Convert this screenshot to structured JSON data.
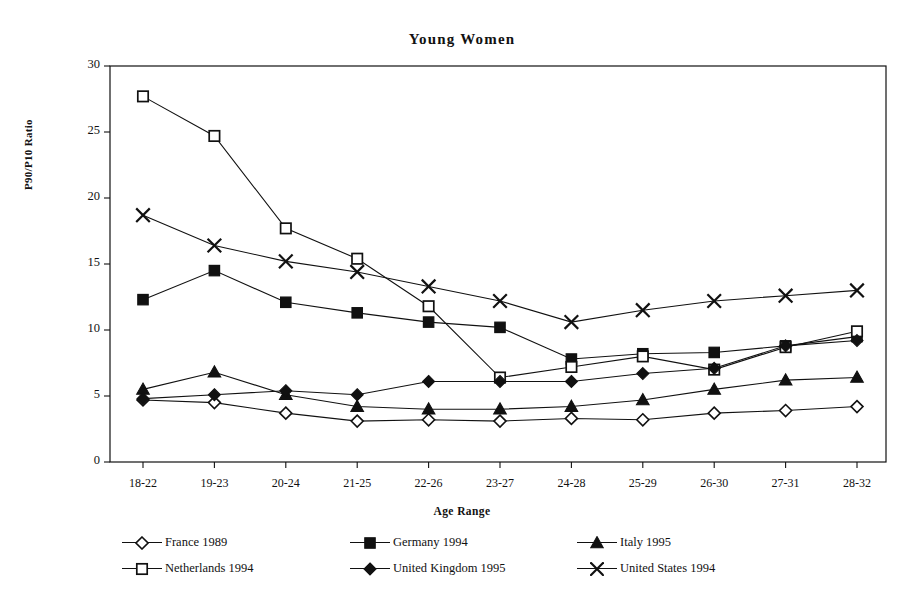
{
  "figure": {
    "title": "Young Women",
    "xlabel": "Age Range",
    "ylabel": "P90/P10 Ratio"
  },
  "axes": {
    "yticks": [
      "0",
      "5",
      "10",
      "15",
      "20",
      "25",
      "30"
    ],
    "xticks": [
      "18-22",
      "19-23",
      "20-24",
      "21-25",
      "22-26",
      "23-27",
      "24-28",
      "25-29",
      "26-30",
      "27-31",
      "28-32"
    ]
  },
  "legend": {
    "rows": [
      [
        {
          "label": "France 1989",
          "marker": "open-diamond"
        },
        {
          "label": "Germany 1994",
          "marker": "filled-square"
        },
        {
          "label": "Italy 1995",
          "marker": "filled-triangle"
        }
      ],
      [
        {
          "label": "Netherlands 1994",
          "marker": "open-square"
        },
        {
          "label": "United Kingdom 1995",
          "marker": "filled-diamond"
        },
        {
          "label": "United States 1994",
          "marker": "cross"
        }
      ]
    ]
  },
  "chart_data": {
    "type": "line",
    "title": "Young Women",
    "xlabel": "Age Range",
    "ylabel": "P90/P10 Ratio",
    "ylim": [
      0,
      30
    ],
    "ytick_step": 5,
    "grid": false,
    "legend_position": "bottom",
    "categories": [
      "18-22",
      "19-23",
      "20-24",
      "21-25",
      "22-26",
      "23-27",
      "24-28",
      "25-29",
      "26-30",
      "27-31",
      "28-32"
    ],
    "series": [
      {
        "name": "France 1989",
        "marker": "open-diamond",
        "values": [
          4.7,
          4.5,
          3.7,
          3.1,
          3.2,
          3.1,
          3.3,
          3.2,
          3.7,
          3.9,
          4.2
        ]
      },
      {
        "name": "Germany 1994",
        "marker": "filled-square",
        "values": [
          12.3,
          14.5,
          12.1,
          11.3,
          10.6,
          10.2,
          7.8,
          8.2,
          8.3,
          8.8,
          9.5
        ]
      },
      {
        "name": "Italy 1995",
        "marker": "filled-triangle",
        "values": [
          5.5,
          6.8,
          5.1,
          4.2,
          4.0,
          4.0,
          4.2,
          4.7,
          5.5,
          6.2,
          6.4
        ]
      },
      {
        "name": "Netherlands 1994",
        "marker": "open-square",
        "values": [
          27.7,
          24.7,
          17.7,
          15.4,
          11.8,
          6.4,
          7.2,
          8.0,
          7.0,
          8.7,
          9.9
        ]
      },
      {
        "name": "United Kingdom 1995",
        "marker": "filled-diamond",
        "values": [
          4.8,
          5.1,
          5.4,
          5.1,
          6.1,
          6.1,
          6.1,
          6.7,
          7.1,
          8.8,
          9.2
        ]
      },
      {
        "name": "United States 1994",
        "marker": "cross",
        "values": [
          18.7,
          16.4,
          15.2,
          14.4,
          13.3,
          12.2,
          10.6,
          11.5,
          12.2,
          12.6,
          13.0
        ]
      }
    ]
  }
}
